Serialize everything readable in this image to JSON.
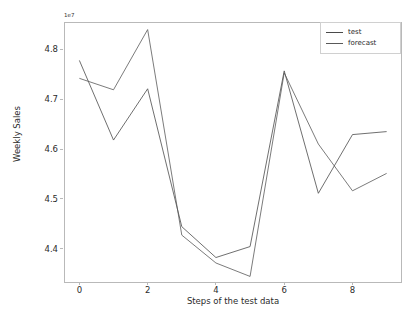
{
  "chart_data": {
    "type": "line",
    "title": "",
    "xlabel": "Steps of the test data",
    "ylabel": "Weekly Sales",
    "offset_text": "1e7",
    "xlim": [
      -0.45,
      9.45
    ],
    "ylim": [
      4.3308,
      4.8552
    ],
    "xticks": [
      0,
      2,
      4,
      6,
      8
    ],
    "xtick_labels": [
      "0",
      "2",
      "4",
      "6",
      "8"
    ],
    "yticks": [
      4.4,
      4.5,
      4.6,
      4.7,
      4.8
    ],
    "ytick_labels": [
      "4.4",
      "4.5",
      "4.6",
      "4.7",
      "4.8"
    ],
    "grid": false,
    "legend_position": "upper right",
    "x": [
      0,
      1,
      2,
      3,
      4,
      5,
      6,
      7,
      8,
      9
    ],
    "series": [
      {
        "name": "test",
        "color": "#4a4a4a",
        "values": [
          4.778,
          4.618,
          4.721,
          4.444,
          4.382,
          4.404,
          4.757,
          4.511,
          4.629,
          4.635
        ]
      },
      {
        "name": "forecast",
        "color": "#595959",
        "values": [
          4.742,
          4.719,
          4.84,
          4.427,
          4.371,
          4.344,
          4.753,
          4.61,
          4.516,
          4.551
        ]
      }
    ]
  },
  "legend": {
    "entries": [
      {
        "label": "test"
      },
      {
        "label": "forecast"
      }
    ]
  }
}
